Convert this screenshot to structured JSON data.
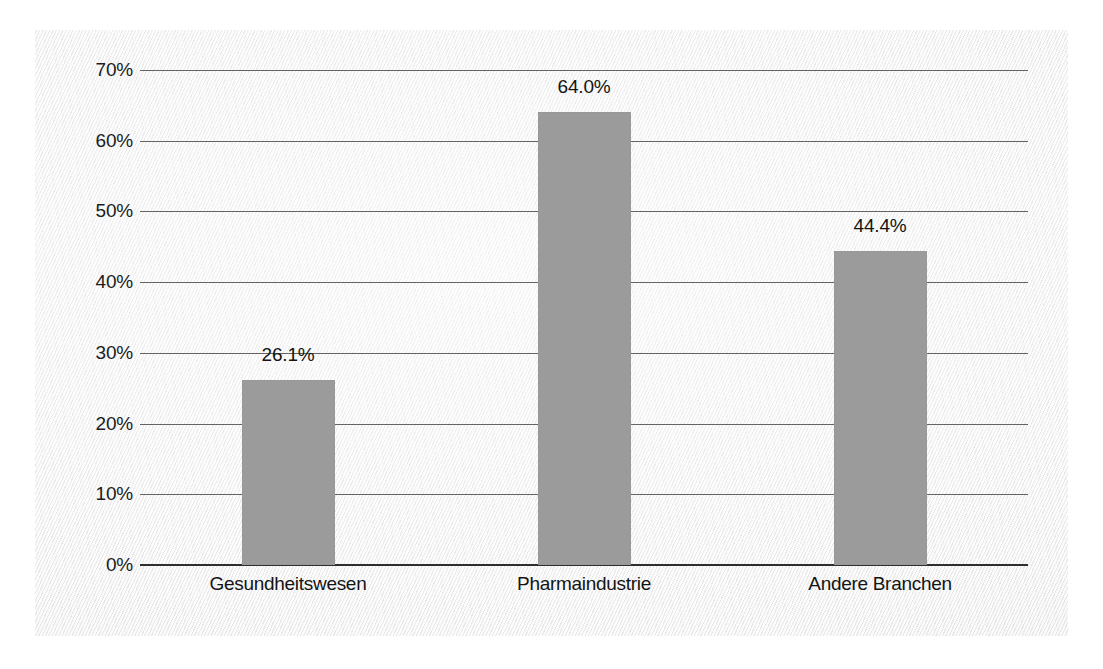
{
  "chart_data": {
    "type": "bar",
    "title": "",
    "subtitle": "",
    "xlabel": "",
    "ylabel": "",
    "categories": [
      "Gesundheitswesen",
      "Pharmaindustrie",
      "Andere Branchen"
    ],
    "values": [
      26.1,
      64.0,
      44.4
    ],
    "value_labels": [
      "26.1%",
      "64.0%",
      "44.4%"
    ],
    "ylim": [
      0,
      70
    ],
    "ytick_step": 10,
    "ytick_labels": [
      "70%",
      "60%",
      "50%",
      "40%",
      "30%",
      "20%",
      "10%",
      "0%"
    ],
    "ytick_values": [
      70,
      60,
      50,
      40,
      30,
      20,
      10,
      0
    ],
    "grid": true,
    "grid_axis": "y",
    "legend": false,
    "legend_position": "none",
    "bar_color": "#9b9b9b",
    "gridline_color": "#4a4a4a",
    "axis_color": "#2e2e2e",
    "text_color": "#141414",
    "plot_background": "#eeeeee"
  }
}
